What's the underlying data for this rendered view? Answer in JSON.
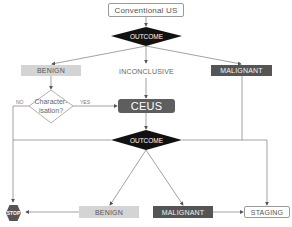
{
  "diagram": {
    "start": "Conventional US",
    "outcome_top": "OUTCOME",
    "branch_top": {
      "benign": "BENIGN",
      "inconclusive": "INCONCLUSIVE",
      "malignant": "MALIGNANT"
    },
    "characterisation": {
      "line1": "Character-",
      "line2": "isation?",
      "no_label": "NO",
      "yes_label": "YES"
    },
    "ceus": "CEUS",
    "outcome_bottom": "OUTCOME",
    "branch_bottom": {
      "stop": "STOP",
      "benign": "BENIGN",
      "malignant": "MALIGNANT",
      "staging": "STAGING"
    },
    "colors": {
      "dark": "#555555",
      "diamond": "#111111",
      "light": "#d4d4d4",
      "line": "#8a8a8a"
    }
  }
}
